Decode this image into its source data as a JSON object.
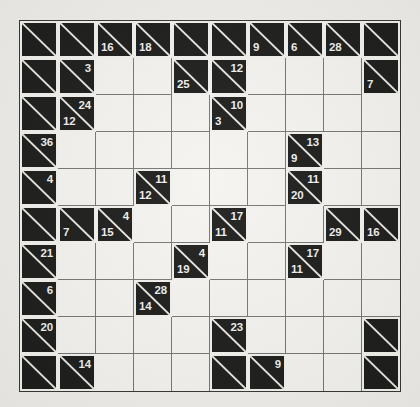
{
  "puzzle": {
    "title": "Kakuro",
    "rows": 10,
    "cols": 10,
    "colors": {
      "clue_fill": "#111110",
      "open_fill": "#f4f3ef",
      "slash": "#e9e8e3",
      "clue_text": "#f0efeb",
      "page_background": "#efeeea",
      "grid_line": "#6f6f6c"
    },
    "legend": {
      "across_position": "upper-right",
      "down_position": "lower-left"
    },
    "cells": [
      [
        {
          "type": "clue"
        },
        {
          "type": "clue"
        },
        {
          "type": "clue",
          "down": "16"
        },
        {
          "type": "clue",
          "down": "18"
        },
        {
          "type": "clue"
        },
        {
          "type": "clue"
        },
        {
          "type": "clue",
          "down": "9"
        },
        {
          "type": "clue",
          "down": "6"
        },
        {
          "type": "clue",
          "down": "28"
        },
        {
          "type": "clue"
        }
      ],
      [
        {
          "type": "clue"
        },
        {
          "type": "clue",
          "across": "3"
        },
        {
          "type": "open",
          "value": ""
        },
        {
          "type": "open",
          "value": ""
        },
        {
          "type": "clue",
          "down": "25"
        },
        {
          "type": "clue",
          "across": "12"
        },
        {
          "type": "open",
          "value": ""
        },
        {
          "type": "open",
          "value": ""
        },
        {
          "type": "open",
          "value": ""
        },
        {
          "type": "clue",
          "down": "7"
        }
      ],
      [
        {
          "type": "clue"
        },
        {
          "type": "clue",
          "across": "24",
          "down": "12"
        },
        {
          "type": "open",
          "value": ""
        },
        {
          "type": "open",
          "value": ""
        },
        {
          "type": "open",
          "value": ""
        },
        {
          "type": "clue",
          "across": "10",
          "down": "3"
        },
        {
          "type": "open",
          "value": ""
        },
        {
          "type": "open",
          "value": ""
        },
        {
          "type": "open",
          "value": ""
        },
        {
          "type": "open",
          "value": ""
        }
      ],
      [
        {
          "type": "clue",
          "across": "36"
        },
        {
          "type": "open",
          "value": ""
        },
        {
          "type": "open",
          "value": ""
        },
        {
          "type": "open",
          "value": ""
        },
        {
          "type": "open",
          "value": ""
        },
        {
          "type": "open",
          "value": ""
        },
        {
          "type": "open",
          "value": ""
        },
        {
          "type": "clue",
          "across": "13",
          "down": "9"
        },
        {
          "type": "open",
          "value": ""
        },
        {
          "type": "open",
          "value": ""
        }
      ],
      [
        {
          "type": "clue",
          "across": "4"
        },
        {
          "type": "open",
          "value": ""
        },
        {
          "type": "open",
          "value": ""
        },
        {
          "type": "clue",
          "across": "11",
          "down": "12"
        },
        {
          "type": "open",
          "value": ""
        },
        {
          "type": "open",
          "value": ""
        },
        {
          "type": "open",
          "value": ""
        },
        {
          "type": "clue",
          "across": "11",
          "down": "20"
        },
        {
          "type": "open",
          "value": ""
        },
        {
          "type": "open",
          "value": ""
        }
      ],
      [
        {
          "type": "clue"
        },
        {
          "type": "clue",
          "down": "7"
        },
        {
          "type": "clue",
          "across": "4",
          "down": "15"
        },
        {
          "type": "open",
          "value": ""
        },
        {
          "type": "open",
          "value": ""
        },
        {
          "type": "clue",
          "across": "17",
          "down": "11"
        },
        {
          "type": "open",
          "value": ""
        },
        {
          "type": "open",
          "value": ""
        },
        {
          "type": "clue",
          "down": "29"
        },
        {
          "type": "clue",
          "down": "16"
        }
      ],
      [
        {
          "type": "clue",
          "across": "21"
        },
        {
          "type": "open",
          "value": ""
        },
        {
          "type": "open",
          "value": ""
        },
        {
          "type": "open",
          "value": ""
        },
        {
          "type": "clue",
          "across": "4",
          "down": "19"
        },
        {
          "type": "open",
          "value": ""
        },
        {
          "type": "open",
          "value": ""
        },
        {
          "type": "clue",
          "across": "17",
          "down": "11"
        },
        {
          "type": "open",
          "value": ""
        },
        {
          "type": "open",
          "value": ""
        }
      ],
      [
        {
          "type": "clue",
          "across": "6"
        },
        {
          "type": "open",
          "value": ""
        },
        {
          "type": "open",
          "value": ""
        },
        {
          "type": "clue",
          "across": "28",
          "down": "14"
        },
        {
          "type": "open",
          "value": ""
        },
        {
          "type": "open",
          "value": ""
        },
        {
          "type": "open",
          "value": ""
        },
        {
          "type": "open",
          "value": ""
        },
        {
          "type": "open",
          "value": ""
        },
        {
          "type": "open",
          "value": ""
        }
      ],
      [
        {
          "type": "clue",
          "across": "20"
        },
        {
          "type": "open",
          "value": ""
        },
        {
          "type": "open",
          "value": ""
        },
        {
          "type": "open",
          "value": ""
        },
        {
          "type": "open",
          "value": ""
        },
        {
          "type": "clue",
          "across": "23"
        },
        {
          "type": "open",
          "value": ""
        },
        {
          "type": "open",
          "value": ""
        },
        {
          "type": "open",
          "value": ""
        },
        {
          "type": "clue"
        }
      ],
      [
        {
          "type": "clue"
        },
        {
          "type": "clue",
          "across": "14"
        },
        {
          "type": "open",
          "value": ""
        },
        {
          "type": "open",
          "value": ""
        },
        {
          "type": "open",
          "value": ""
        },
        {
          "type": "clue"
        },
        {
          "type": "clue",
          "across": "9"
        },
        {
          "type": "open",
          "value": ""
        },
        {
          "type": "open",
          "value": ""
        },
        {
          "type": "clue"
        }
      ]
    ]
  }
}
